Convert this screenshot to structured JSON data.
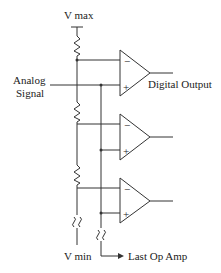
{
  "diagram": {
    "labels": {
      "vmax": "V max",
      "vmin": "V min",
      "analog_line1": "Analog",
      "analog_line2": "Signal",
      "digital_output": "Digital Output",
      "last_op_amp": "Last Op Amp"
    },
    "opamps": [
      {
        "minus": "−",
        "plus": "+"
      },
      {
        "minus": "−",
        "plus": "+"
      },
      {
        "minus": "−",
        "plus": "+"
      }
    ],
    "colors": {
      "line": "#333333",
      "text": "#222222",
      "background": "#ffffff"
    }
  }
}
